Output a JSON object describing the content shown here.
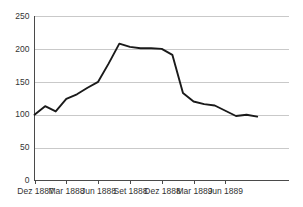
{
  "chart_data": {
    "type": "line",
    "title": "",
    "subtitle": "",
    "xlabel": "",
    "ylabel": "",
    "grid": "horizontal",
    "legend": "none",
    "ylim": [
      0,
      250
    ],
    "yticks": [
      0,
      50,
      100,
      150,
      200,
      250
    ],
    "ytick_labels": [
      "0",
      "50",
      "100",
      "150",
      "200",
      "250"
    ],
    "xtick_labels": [
      "Dez 1887",
      "Mar 1888",
      "Jun 1888",
      "Set 1888",
      "Dez 1888",
      "Mar 1889",
      "Jun 1889"
    ],
    "xtick_positions": [
      0,
      3,
      6,
      9,
      12,
      15,
      18
    ],
    "x": [
      0,
      1,
      2,
      3,
      4,
      5,
      6,
      7,
      8,
      9,
      10,
      11,
      12,
      13,
      14,
      15,
      16,
      17,
      18,
      19,
      20,
      21
    ],
    "x_labels": [
      "Dez 1887",
      "Jan 1888",
      "Feb 1888",
      "Mar 1888",
      "Abr 1888",
      "Mai 1888",
      "Jun 1888",
      "Jul 1888",
      "Ago 1888",
      "Set 1888",
      "Out 1888",
      "Nov 1888",
      "Dez 1888",
      "Jan 1889",
      "Fev 1889",
      "Mar 1889",
      "Abr 1889",
      "Mai 1889",
      "Jun 1889",
      "Jul 1889",
      "Ago 1889",
      "Set 1889"
    ],
    "series": [
      {
        "name": "index",
        "values": [
          100,
          113,
          105,
          124,
          131,
          141,
          150,
          178,
          208,
          203,
          201,
          201,
          200,
          191,
          133,
          120,
          116,
          114,
          106,
          98,
          100,
          97
        ]
      }
    ],
    "colors": {
      "line": "#1a1a1a",
      "grid": "#c9c9c9",
      "axis": "#4a4a4a",
      "text": "#333333",
      "background": "#ffffff"
    }
  }
}
